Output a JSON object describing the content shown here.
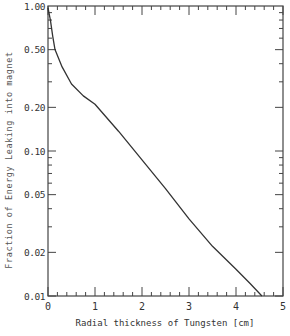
{
  "chart_data": {
    "type": "line",
    "title": "",
    "xlabel": "Radial thickness of Tungsten [cm]",
    "ylabel": "Fraction of Energy Leaking into magnet",
    "xlim": [
      0,
      5
    ],
    "ylim": [
      0.01,
      1.0
    ],
    "yscale": "log",
    "grid": false,
    "legend": null,
    "x_ticks": [
      "0",
      "1",
      "2",
      "3",
      "4",
      "5"
    ],
    "y_ticks": [
      "0.01",
      "0.02",
      "0.05",
      "0.10",
      "0.20",
      "0.50",
      "1.00"
    ],
    "series": [
      {
        "name": "Energy leakage",
        "x": [
          0.0,
          0.05,
          0.1,
          0.15,
          0.3,
          0.5,
          0.75,
          1.0,
          1.5,
          2.0,
          2.5,
          3.0,
          3.5,
          4.0,
          4.3,
          4.55
        ],
        "y": [
          0.97,
          0.8,
          0.62,
          0.5,
          0.38,
          0.29,
          0.24,
          0.21,
          0.137,
          0.087,
          0.055,
          0.034,
          0.022,
          0.0153,
          0.0122,
          0.01
        ]
      }
    ]
  }
}
